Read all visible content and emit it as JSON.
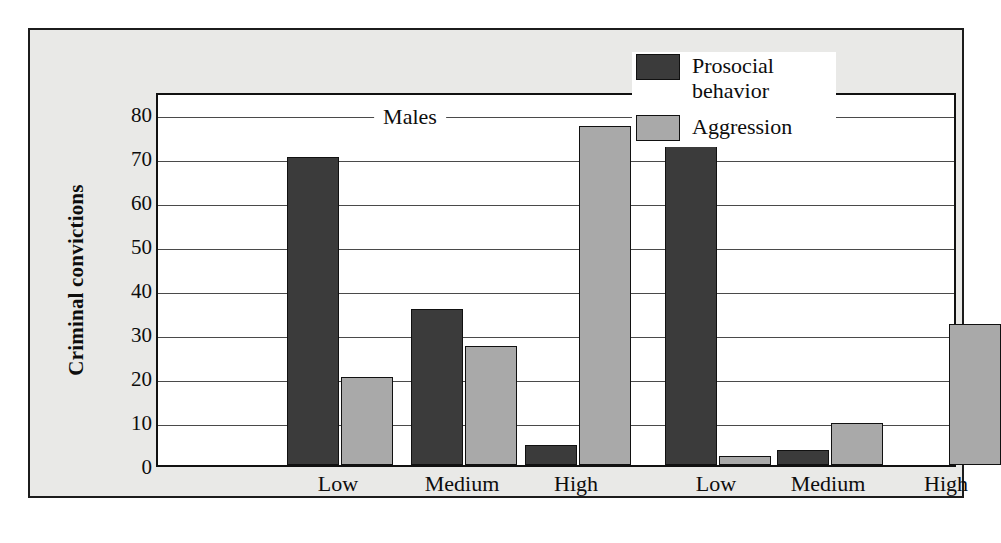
{
  "chart_data": {
    "type": "bar",
    "title": "",
    "xlabel": "",
    "ylabel": "Criminal convictions",
    "ylim": [
      0,
      85
    ],
    "yticks": [
      0,
      10,
      20,
      30,
      40,
      50,
      60,
      70,
      80
    ],
    "grid": true,
    "legend_position": "top-right",
    "group_labels": [
      "Males",
      "Females"
    ],
    "categories": [
      "Low",
      "Medium",
      "High",
      "Low",
      "Medium",
      "High"
    ],
    "group_of_category": [
      "Males",
      "Males",
      "Males",
      "Females",
      "Females",
      "Females"
    ],
    "series": [
      {
        "name": "Prosocial behavior",
        "color": "#3b3b3b",
        "values": [
          70,
          35.5,
          4.5,
          77.5,
          3.5,
          0
        ]
      },
      {
        "name": "Aggression",
        "color": "#a9a9a9",
        "values": [
          20,
          27,
          77,
          2,
          9.5,
          32
        ]
      }
    ]
  },
  "axis": {
    "y_title": "Criminal convictions",
    "y_tick_labels": [
      "80",
      "70",
      "60",
      "50",
      "40",
      "30",
      "20",
      "10",
      "0"
    ],
    "x_tick_labels": [
      "Low",
      "Medium",
      "High",
      "Low",
      "Medium",
      "High"
    ]
  },
  "groups": {
    "males_label": "Males",
    "females_label": "Females"
  },
  "legend": {
    "items": [
      {
        "label": "Prosocial behavior",
        "color": "#3b3b3b",
        "swatch_name": "prosocial-swatch"
      },
      {
        "label": "Aggression",
        "color": "#a9a9a9",
        "swatch_name": "aggression-swatch"
      }
    ]
  },
  "style": {
    "panel_background": "#e9e9e7",
    "plot_background": "#ffffff",
    "border_color": "#1c1c1c",
    "gridline_color": "#4a4a4a",
    "text_color": "#0d0d0d"
  }
}
